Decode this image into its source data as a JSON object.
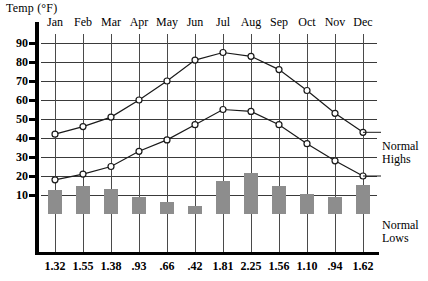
{
  "chart_title": "Temp (°F)",
  "axis": {
    "y_title": "Temp (°F)",
    "y_ticks": [
      90,
      80,
      70,
      60,
      50,
      40,
      30,
      20,
      10
    ],
    "y_min": 0,
    "y_max": 95
  },
  "legend": {
    "highs_line1": "Normal",
    "highs_line2": "Highs",
    "lows_line1": "Normal",
    "lows_line2": "Lows"
  },
  "colors": {
    "bar_fill": "#8d8d8d",
    "line_stroke": "#1a1a1a",
    "marker_fill": "#ffffff",
    "grid": "#3a3a3a",
    "axis": "#000000"
  },
  "chart_data": {
    "type": "line",
    "title": "Temp (°F)",
    "xlabel": "",
    "ylabel": "Temp (°F)",
    "ylim": [
      0,
      95
    ],
    "grid": true,
    "legend_position": "right",
    "categories": [
      "Jan",
      "Feb",
      "Mar",
      "Apr",
      "May",
      "Jun",
      "Jul",
      "Aug",
      "Sep",
      "Oct",
      "Nov",
      "Dec"
    ],
    "series": [
      {
        "name": "Normal Highs",
        "type": "line",
        "unit": "°F",
        "values": [
          42,
          46,
          51,
          60,
          70,
          81,
          85,
          83,
          76,
          65,
          53,
          43
        ]
      },
      {
        "name": "Normal Lows",
        "type": "line",
        "unit": "°F",
        "values": [
          18,
          21,
          25,
          33,
          39,
          47,
          55,
          54,
          47,
          37,
          28,
          20
        ]
      },
      {
        "name": "Precipitation",
        "type": "bar",
        "unit": "in",
        "values": [
          1.32,
          1.55,
          1.38,
          0.93,
          0.66,
          0.42,
          1.81,
          2.25,
          1.56,
          1.1,
          0.94,
          1.62
        ],
        "labels": [
          "1.32",
          "1.55",
          "1.38",
          ".93",
          ".66",
          ".42",
          "1.81",
          "2.25",
          "1.56",
          "1.10",
          ".94",
          "1.62"
        ]
      }
    ]
  }
}
